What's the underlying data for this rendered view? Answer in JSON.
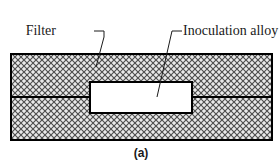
{
  "figure": {
    "caption": "(a)",
    "colors": {
      "background": "#ffffff",
      "outline": "#000000",
      "hatch_ink": "#5a5a5a",
      "hatch_fill": "#e8e8e8",
      "text": "#1a1a1a",
      "insert_fill": "#ffffff"
    },
    "labels": [
      {
        "id": "filter",
        "text": "Filter",
        "text_x": 56,
        "text_y": 35,
        "leader": "M 94 31 L 104 31 L 104 37 L 96 67"
      },
      {
        "id": "inoculation-alloy",
        "text": "Inoculation alloy",
        "text_x": 183,
        "text_y": 35,
        "leader": "M 182 31 L 172 31 L 157 97"
      }
    ],
    "parts": {
      "mold": {
        "name": "filter",
        "x": 11,
        "y": 54,
        "width": 261,
        "height": 86,
        "hatch": "cross-diagonal"
      },
      "parting_line": {
        "name": "mold-parting-line",
        "x1": 11,
        "y1": 97,
        "x2": 272,
        "y2": 97
      },
      "insert": {
        "name": "inoculation-alloy",
        "x": 90,
        "y": 82,
        "width": 102,
        "height": 31
      }
    }
  }
}
